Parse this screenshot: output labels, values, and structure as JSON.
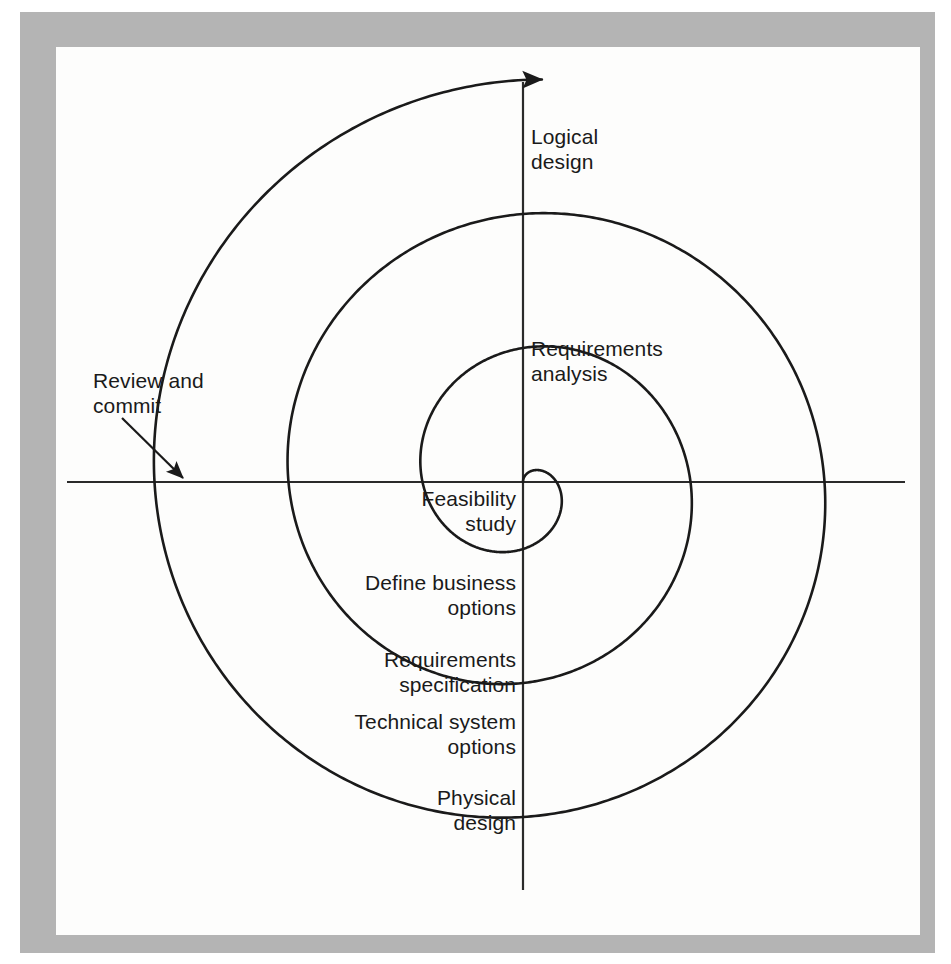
{
  "figure": {
    "type": "spiral-diagram",
    "title_visible": false,
    "background_color": "#fdfdfc",
    "frame_color": "#b4b4b4",
    "line_color": "#1a1a1a"
  },
  "axes": {
    "center": {
      "x": 523,
      "y": 482
    },
    "vertical": {
      "x": 523,
      "y_top": 82,
      "y_bottom": 890
    },
    "horizontal": {
      "y": 482,
      "x_left": 67,
      "x_right": 905
    }
  },
  "spiral": {
    "description": "Archimedean spiral expanding outward counter-clockwise from centre",
    "turn_step_px": 67,
    "start_radius_px": 0,
    "end_radius_px": 403,
    "axis_crossings": {
      "up": [
        385,
        337,
        262,
        190,
        125
      ],
      "right": [
        603,
        670,
        737,
        803,
        870
      ],
      "down": [
        578,
        645,
        707,
        772,
        840
      ],
      "left": [
        453,
        387,
        320,
        252,
        185
      ]
    },
    "terminal_arrow": {
      "x": 120,
      "y": 482,
      "direction": "up"
    }
  },
  "labels": [
    {
      "id": "logical-design",
      "text": "Logical\ndesign",
      "quadrant": "top-right",
      "align": "left",
      "x": 531,
      "y": 124
    },
    {
      "id": "requirements-analysis",
      "text": "Requirements\nanalysis",
      "quadrant": "top-right",
      "align": "left",
      "x": 531,
      "y": 336
    },
    {
      "id": "feasibility-study",
      "text": "Feasibility\nstudy",
      "quadrant": "bottom-left",
      "align": "right",
      "x": 516,
      "y": 486
    },
    {
      "id": "define-business-options",
      "text": "Define business\noptions",
      "quadrant": "bottom-left",
      "align": "right",
      "x": 516,
      "y": 570
    },
    {
      "id": "requirements-specification",
      "text": "Requirements\nspecification",
      "quadrant": "bottom-left",
      "align": "right",
      "x": 516,
      "y": 647
    },
    {
      "id": "technical-system-options",
      "text": "Technical system\noptions",
      "quadrant": "bottom-left",
      "align": "right",
      "x": 516,
      "y": 709
    },
    {
      "id": "physical-design",
      "text": "Physical\ndesign",
      "quadrant": "bottom-left",
      "align": "right",
      "x": 516,
      "y": 785
    }
  ],
  "annotation": {
    "id": "review-and-commit",
    "text": "Review and\ncommit",
    "x": 93,
    "y": 368,
    "arrow": {
      "from_x": 122,
      "from_y": 418,
      "to_x": 183,
      "to_y": 478
    }
  },
  "callouts": {
    "logical_design": "Logical design",
    "requirements_analysis": "Requirements analysis",
    "feasibility_study": "Feasibility study",
    "define_business_options": "Define business options",
    "requirements_specification": "Requirements specification",
    "technical_system_options": "Technical system options",
    "physical_design": "Physical design",
    "review_and_commit": "Review and commit"
  }
}
